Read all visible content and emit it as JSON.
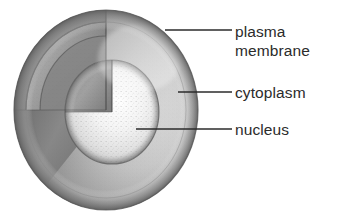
{
  "figure": {
    "kind": "biological-illustration",
    "style": "grayscale pencil shading",
    "background_color": "#ffffff",
    "ink_color": "#2b2b2b",
    "labels": [
      {
        "id": "plasma-membrane",
        "line1": "plasma",
        "line2": "membrane",
        "leader": {
          "x1": 165,
          "y1": 30,
          "x2": 232,
          "y2": 30
        }
      },
      {
        "id": "cytoplasm",
        "line1": "cytoplasm",
        "line2": "",
        "leader": {
          "x1": 178,
          "y1": 92,
          "x2": 232,
          "y2": 92
        }
      },
      {
        "id": "nucleus",
        "line1": "nucleus",
        "line2": "",
        "leader": {
          "x1": 136,
          "y1": 129,
          "x2": 232,
          "y2": 129
        }
      }
    ],
    "structures": [
      {
        "name": "plasma-membrane",
        "description": "outer spherical boundary of the cell"
      },
      {
        "name": "cytoplasm",
        "description": "shell region between membrane and nucleus"
      },
      {
        "name": "nucleus",
        "description": "bright stippled sphere at the cell centre"
      }
    ],
    "geometry": {
      "cell_center_x": 106,
      "cell_center_y": 110,
      "cell_radius": 96,
      "cytoplasm_radius": 80,
      "nucleus_center_x": 112,
      "nucleus_center_y": 112,
      "nucleus_radius": 48
    }
  }
}
